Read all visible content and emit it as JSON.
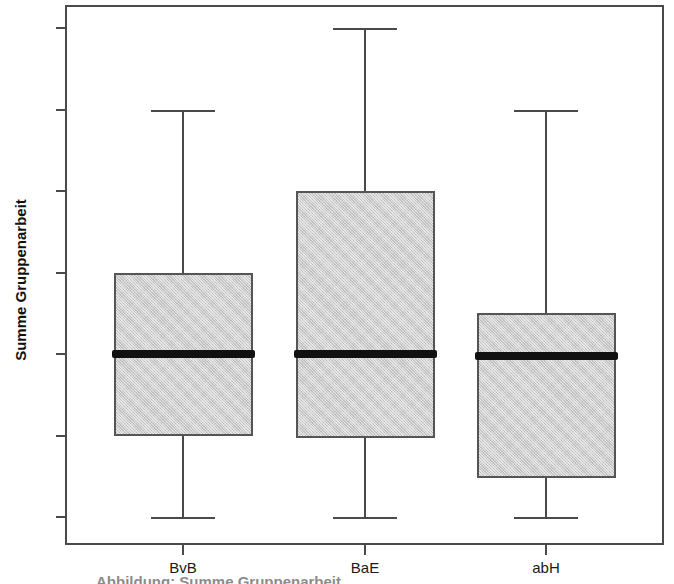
{
  "chart_data": {
    "type": "box",
    "title": "",
    "subtitle": "",
    "xlabel": "",
    "ylabel": "Summe Gruppenarbeit",
    "categories": [
      "BvB",
      "BaE",
      "abH"
    ],
    "ytick_labels": [
      "0",
      "1",
      "2",
      "3",
      "4",
      "5",
      "6"
    ],
    "ytick_values": [
      0,
      1,
      2,
      3,
      4,
      5,
      6
    ],
    "ylim": [
      -0.35,
      6.6
    ],
    "grid": false,
    "legend": "none",
    "box_fill_color": "#cdcdcd",
    "box_edge_color": "#555555",
    "median_color": "#111111",
    "whisker_color": "#4a4a4a",
    "frame_color": "#4a4a4a",
    "boxes": [
      {
        "category": "BvB",
        "whisker_low": 0,
        "q1": 1,
        "median": 2,
        "q3": 3,
        "whisker_high": 5,
        "outliers": []
      },
      {
        "category": "BaE",
        "whisker_low": 0,
        "q1": 0.97,
        "median": 2,
        "q3": 4,
        "whisker_high": 6,
        "outliers": []
      },
      {
        "category": "abH",
        "whisker_low": 0,
        "q1": 0.48,
        "median": 1.98,
        "q3": 2.5,
        "whisker_high": 5,
        "outliers": []
      }
    ]
  },
  "axis": {
    "y_title": "Summe Gruppenarbeit"
  },
  "caption": {
    "clipped_line": "Abbildung: Summe Gruppenarbeit"
  }
}
